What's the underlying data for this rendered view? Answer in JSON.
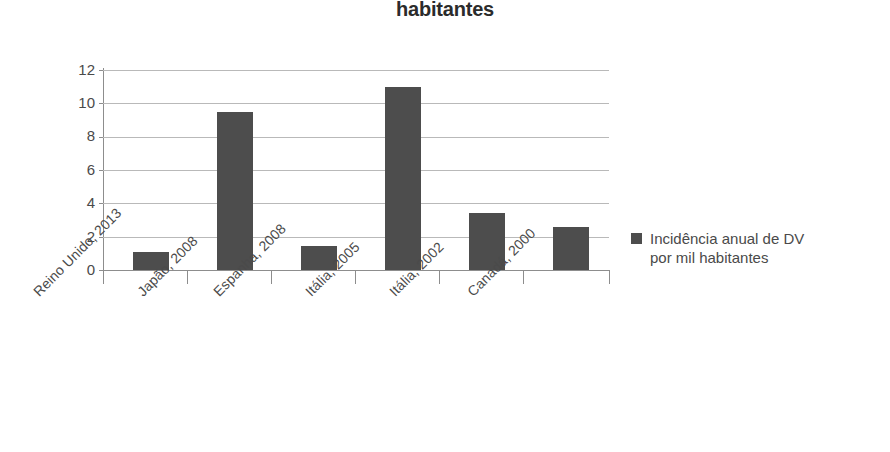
{
  "chart_data": {
    "type": "bar",
    "title": "habitantes",
    "title_note": "Title is cropped by the screenshot; only the last line is visible.",
    "xlabel": "",
    "ylabel": "",
    "ylim": [
      0,
      12
    ],
    "yticks": [
      0,
      2,
      4,
      6,
      8,
      10,
      12
    ],
    "grid": true,
    "legend_position": "right",
    "bar_color": "#4d4d4d",
    "grid_color": "#b9b9b9",
    "axis_color": "#8d8d8d",
    "categories": [
      "Reino Unido, 2013",
      "Japão, 2008",
      "Espanha, 2008",
      "Itália, 2005",
      "Itália, 2002",
      "Canadá, 2000"
    ],
    "values": [
      1.1,
      9.5,
      1.45,
      11.0,
      3.4,
      2.6
    ],
    "series": [
      {
        "name": "Incidência anual de DV por mil habitantes",
        "values": [
          1.1,
          9.5,
          1.45,
          11.0,
          3.4,
          2.6
        ]
      }
    ],
    "legend": [
      {
        "label_line1": "Incidência anual de DV",
        "label_line2": "por mil habitantes",
        "color": "#4d4d4d"
      }
    ]
  },
  "ytick_labels": [
    "12",
    "10",
    "8",
    "6",
    "4",
    "2",
    "0"
  ],
  "legend": {
    "line1": "Incidência anual de DV",
    "line2": "por mil habitantes"
  }
}
